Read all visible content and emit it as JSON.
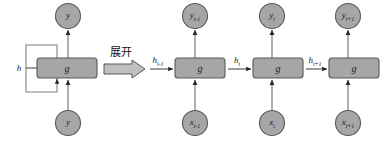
{
  "diagram": {
    "colors": {
      "node_fill": "#a6a6a6",
      "node_stroke": "#595959",
      "box_fill": "#a6a6a6",
      "box_stroke": "#595959",
      "arrow": "#808080",
      "arrow_head": "#262626",
      "loop_stroke": "#808080",
      "text": "#1a1a1a",
      "background": "#ffffff"
    },
    "transition": {
      "caption": "展开",
      "arrow_name": "block-arrow-right"
    },
    "folded": {
      "output_node": {
        "base": "y",
        "sub": ""
      },
      "cell": {
        "label": "g"
      },
      "input_node": {
        "base": "y",
        "sub": ""
      },
      "recurrent_label": {
        "base": "h",
        "sub": ""
      }
    },
    "unfolded": {
      "steps": [
        {
          "state_in": {
            "base": "h",
            "sub": "t-1"
          },
          "output_node": {
            "base": "y",
            "sub": "t-1"
          },
          "cell": {
            "label": "g"
          },
          "input_node": {
            "base": "x",
            "sub": "t-1"
          }
        },
        {
          "state_in": {
            "base": "h",
            "sub": "t"
          },
          "output_node": {
            "base": "y",
            "sub": "t"
          },
          "cell": {
            "label": "g"
          },
          "input_node": {
            "base": "x",
            "sub": "t"
          }
        },
        {
          "state_in": {
            "base": "h",
            "sub": "t+1"
          },
          "output_node": {
            "base": "y",
            "sub": "t+1"
          },
          "cell": {
            "label": "g"
          },
          "input_node": {
            "base": "x",
            "sub": "t+1"
          }
        }
      ]
    }
  }
}
